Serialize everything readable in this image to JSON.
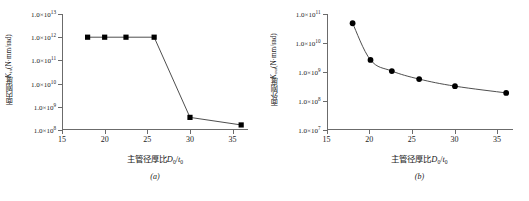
{
  "figure": {
    "background": "#ffffff",
    "axis_color": "#6b6b6b",
    "marker_color": "#000000",
    "line_color": "#3a3a3a"
  },
  "panels": [
    {
      "caption": "(a)",
      "ytitle_cjk": "面内刚度",
      "ytitle_sym": "K",
      "ytitle_sub": "in",
      "ytitle_unit": "(N·mm/rad)",
      "xtitle_cjk": "主管径厚比",
      "xtitle_sym_num": "D",
      "xtitle_sub_num": "0",
      "xtitle_slash": "/",
      "xtitle_sym_den": "t",
      "xtitle_sub_den": "0",
      "ylabels": [
        "1.0×10",
        "1.0×10",
        "1.0×10",
        "1.0×10",
        "1.0×10",
        "1.0×10"
      ],
      "yexps": [
        "13",
        "12",
        "11",
        "10",
        "9",
        "8"
      ],
      "xlabels": [
        "15",
        "20",
        "25",
        "30",
        "35"
      ]
    },
    {
      "caption": "(b)",
      "ytitle_cjk": "面外刚度",
      "ytitle_sym": "K",
      "ytitle_sub": "out",
      "ytitle_unit": "(N·mm/rad)",
      "xtitle_cjk": "主管径厚比",
      "xtitle_sym_num": "D",
      "xtitle_sub_num": "0",
      "xtitle_slash": "/",
      "xtitle_sym_den": "t",
      "xtitle_sub_den": "0",
      "ylabels": [
        "1.0×10",
        "1.0×10",
        "1.0×10",
        "1.0×10",
        "1.0×10"
      ],
      "yexps": [
        "11",
        "10",
        "9",
        "8",
        "7"
      ],
      "xlabels": [
        "15",
        "20",
        "25",
        "30",
        "35"
      ]
    }
  ],
  "chart_data": [
    {
      "type": "line",
      "title": "(a)",
      "xlabel": "主管径厚比D0/t0",
      "ylabel": "面内刚度Kin(N·mm/rad)",
      "yscale": "log",
      "xlim": [
        15,
        36.8
      ],
      "ylim": [
        100000000,
        10000000000000
      ],
      "yticks": [
        100000000,
        1000000000,
        10000000000,
        100000000000,
        1000000000000,
        10000000000000
      ],
      "ytick_labels": [
        "1.0×10^8",
        "1.0×10^9",
        "1.0×10^10",
        "1.0×10^11",
        "1.0×10^12",
        "1.0×10^13"
      ],
      "xticks": [
        15,
        20,
        25,
        30,
        35
      ],
      "grid": false,
      "legend": false,
      "marker": "square",
      "x": [
        18.0,
        20.0,
        22.5,
        25.8,
        30.0,
        36.0
      ],
      "values": [
        1000000000000,
        1000000000000,
        1000000000000,
        1000000000000,
        350000000,
        165000000
      ]
    },
    {
      "type": "line",
      "title": "(b)",
      "xlabel": "主管径厚比D0/t0",
      "ylabel": "面外刚度Kout(N·mm/rad)",
      "yscale": "log",
      "xlim": [
        15,
        36.8
      ],
      "ylim": [
        10000000,
        100000000000
      ],
      "yticks": [
        10000000,
        100000000,
        1000000000,
        10000000000,
        100000000000
      ],
      "ytick_labels": [
        "1.0×10^7",
        "1.0×10^8",
        "1.0×10^9",
        "1.0×10^10",
        "1.0×10^11"
      ],
      "xticks": [
        15,
        20,
        25,
        30,
        35
      ],
      "grid": false,
      "legend": false,
      "marker": "circle",
      "x": [
        18.0,
        20.1,
        22.6,
        25.8,
        30.0,
        36.0
      ],
      "values": [
        48000000000,
        2600000000,
        1080000000,
        570000000,
        325000000,
        190000000
      ]
    }
  ]
}
